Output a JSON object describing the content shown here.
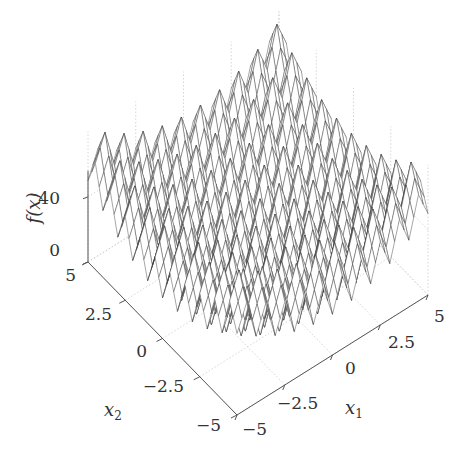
{
  "chart_data": {
    "type": "surface",
    "title": "",
    "function": "Rastrigin",
    "xlabel": "x_1",
    "ylabel": "x_2",
    "zlabel": "f(x)",
    "xlabel_display": "x",
    "xlabel_sub": "1",
    "ylabel_display": "x",
    "ylabel_sub": "2",
    "zlabel_display": "f(x)",
    "xlim": [
      -5,
      5
    ],
    "ylim": [
      -5,
      5
    ],
    "zlim": [
      0,
      80
    ],
    "x_ticks": [
      -5,
      -2.5,
      0,
      2.5,
      5
    ],
    "x_tick_labels": [
      "−5",
      "−2.5",
      "0",
      "2.5",
      "5"
    ],
    "y_ticks": [
      -5,
      -2.5,
      0,
      2.5,
      5
    ],
    "y_tick_labels": [
      "−5",
      "−2.5",
      "0",
      "2.5",
      "5"
    ],
    "z_ticks": [
      0,
      40
    ],
    "z_tick_labels": [
      "0",
      "40"
    ],
    "grid": true,
    "mesh_resolution": 41,
    "mesh_color": "#3a3a3a",
    "axis_color": "#555555",
    "grid_color": "#cccccc",
    "annotations": []
  }
}
